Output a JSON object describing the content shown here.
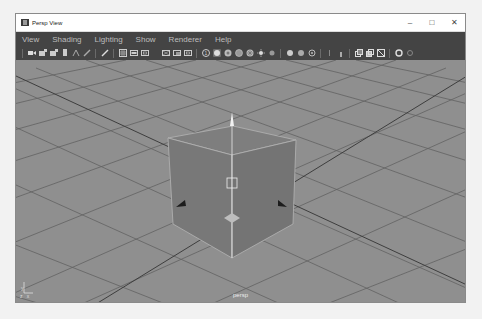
{
  "window": {
    "title": "Persp View",
    "controls": {
      "minimize": "–",
      "maximize": "□",
      "close": "✕"
    }
  },
  "menubar": {
    "items": [
      {
        "label": "View"
      },
      {
        "label": "Shading"
      },
      {
        "label": "Lighting"
      },
      {
        "label": "Show"
      },
      {
        "label": "Renderer"
      },
      {
        "label": "Help"
      }
    ]
  },
  "toolbar": {
    "groups": [
      [
        "select-camera-icon",
        "camera-attributes-icon",
        "bookmarks-icon",
        "image-plane-icon"
      ],
      [
        "2d-pan-zoom-icon",
        "grease-pencil-icon"
      ],
      [
        "grid-icon",
        "film-gate-icon",
        "resolution-gate-icon",
        "gate-mask-icon",
        "field-chart-icon",
        "safe-action-icon"
      ],
      [
        "isolate-select-icon",
        "xray-icon",
        "wireframe-icon",
        "smooth-shade-icon",
        "textured-icon",
        "use-all-lights-icon",
        "shadows-icon"
      ],
      [
        "screen-space-ao-icon",
        "motion-blur-icon",
        "multisample-aa-icon"
      ],
      [
        "depth-of-field-icon",
        "hud-icon"
      ],
      [
        "exposure-icon",
        "gamma-icon",
        "color-management-icon"
      ],
      [
        "settings-icon"
      ]
    ]
  },
  "viewport": {
    "camera_label": "persp",
    "axis_labels": {
      "y": "y",
      "x": "x",
      "z": "z"
    },
    "colors": {
      "background": "#8f8f8f",
      "grid_line": "#5a5a5a",
      "cube_face": "#7d7d7d",
      "cube_edge": "#b0b0b0"
    }
  }
}
